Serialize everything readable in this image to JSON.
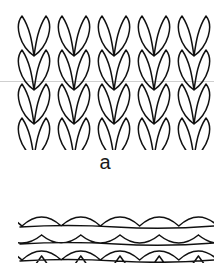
{
  "figure": {
    "caption_a": "a",
    "knit_panel": {
      "columns": 5,
      "rows": 4,
      "stitch": "knit-v"
    },
    "purl_panel": {
      "columns": 5,
      "rows": 3,
      "stitch": "purl-bump"
    },
    "colors": {
      "stroke": "#111111",
      "background": "#ffffff",
      "guide_line": "#cfcfcf"
    }
  }
}
